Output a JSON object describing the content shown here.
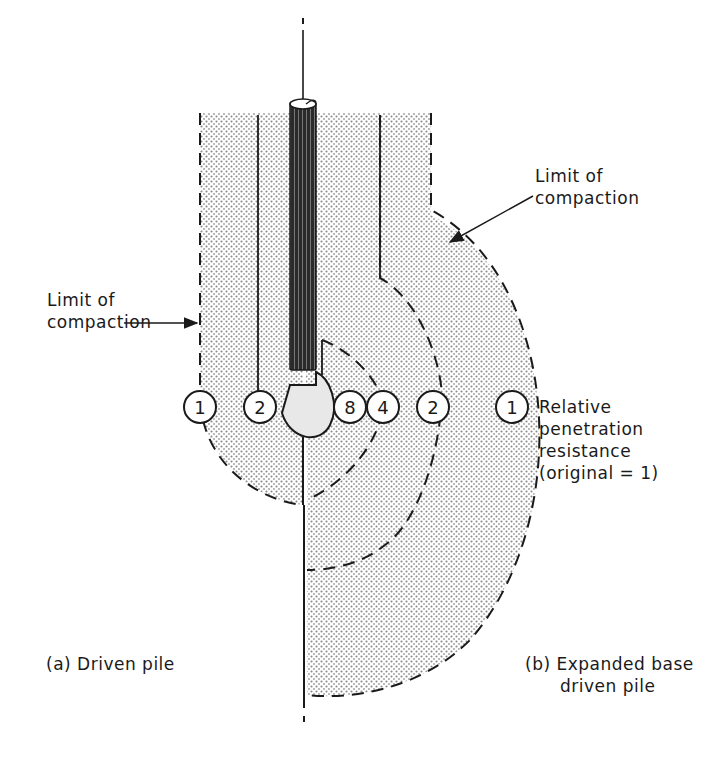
{
  "figure": {
    "type": "geotechnical-diagram",
    "colors": {
      "ink": "#1a1a1a",
      "shading": "#9a9a9a",
      "background": "#ffffff"
    }
  },
  "labels": {
    "limit_left_line1": "Limit of",
    "limit_left_line2": "compaction",
    "limit_right_line1": "Limit of",
    "limit_right_line2": "compaction",
    "legend_line1": "Relative",
    "legend_line2": "penetration",
    "legend_line3": "resistance",
    "legend_line4": "(original = 1)",
    "caption_a": "(a)  Driven  pile",
    "caption_b_line1": "(b) Expanded base",
    "caption_b_line2": "driven pile"
  },
  "markers": [
    {
      "id": "a-outer",
      "value": "1"
    },
    {
      "id": "a-inner",
      "value": "2"
    },
    {
      "id": "b-inner",
      "value": "8"
    },
    {
      "id": "b-mid",
      "value": "4"
    },
    {
      "id": "b-outer2",
      "value": "2"
    },
    {
      "id": "b-outer1",
      "value": "1"
    }
  ]
}
